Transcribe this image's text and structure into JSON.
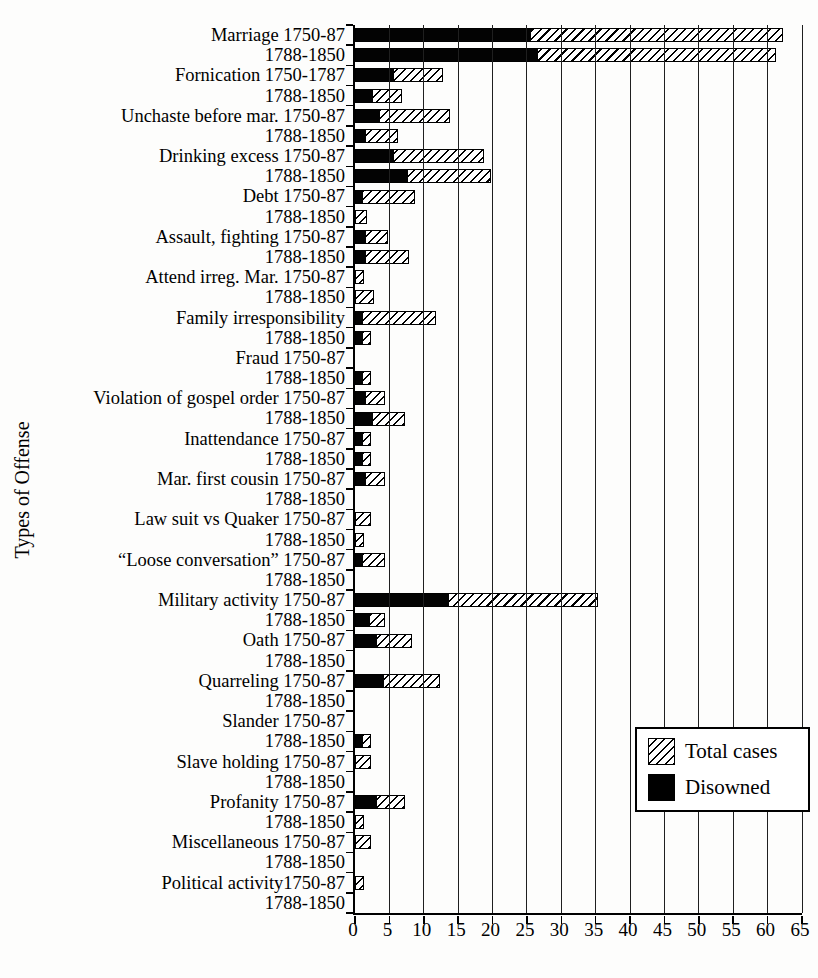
{
  "figure_colors": {
    "background": "#fdfdfc",
    "bar_fill": "#000000",
    "hatch_line": "#000000",
    "grid_line": "#1f1f1f"
  },
  "chart_data": {
    "type": "bar",
    "orientation": "horizontal",
    "title": "",
    "xlabel": "",
    "ylabel": "Types of Offense",
    "xlim": [
      0,
      65
    ],
    "xticks": [
      0,
      5,
      10,
      15,
      20,
      25,
      30,
      35,
      40,
      45,
      50,
      55,
      60,
      65
    ],
    "grid": true,
    "legend_position": "bottom-right",
    "series": [
      {
        "name": "Total cases",
        "style": "hatched"
      },
      {
        "name": "Disowned",
        "style": "solid-black"
      }
    ],
    "rows": [
      {
        "label": "Marriage 1750-87",
        "disowned": 25.5,
        "total": 62
      },
      {
        "label": "1788-1850",
        "disowned": 26.5,
        "total": 61
      },
      {
        "label": "Fornication 1750-1787",
        "disowned": 5.5,
        "total": 12.5
      },
      {
        "label": "1788-1850",
        "disowned": 2.5,
        "total": 6.5
      },
      {
        "label": "Unchaste before mar. 1750-87",
        "disowned": 3.5,
        "total": 13.5
      },
      {
        "label": "1788-1850",
        "disowned": 1.5,
        "total": 6
      },
      {
        "label": "Drinking excess 1750-87",
        "disowned": 5.5,
        "total": 18.5
      },
      {
        "label": "1788-1850",
        "disowned": 7.5,
        "total": 19.5
      },
      {
        "label": "Debt 1750-87",
        "disowned": 1,
        "total": 8.5
      },
      {
        "label": "1788-1850",
        "disowned": 0,
        "total": 1.5
      },
      {
        "label": "Assault, fighting 1750-87",
        "disowned": 1.5,
        "total": 4.5
      },
      {
        "label": "1788-1850",
        "disowned": 1.5,
        "total": 7.5
      },
      {
        "label": "Attend irreg. Mar. 1750-87",
        "disowned": 0,
        "total": 1
      },
      {
        "label": "1788-1850",
        "disowned": 0,
        "total": 2.5
      },
      {
        "label": "Family irresponsibility",
        "disowned": 1,
        "total": 11.5
      },
      {
        "label": "1788-1850",
        "disowned": 1,
        "total": 2
      },
      {
        "label": "Fraud 1750-87",
        "disowned": 0,
        "total": 0
      },
      {
        "label": "1788-1850",
        "disowned": 1,
        "total": 2
      },
      {
        "label": "Violation of gospel order 1750-87",
        "disowned": 1.5,
        "total": 4
      },
      {
        "label": "1788-1850",
        "disowned": 2.5,
        "total": 7
      },
      {
        "label": "Inattendance 1750-87",
        "disowned": 1,
        "total": 2
      },
      {
        "label": "1788-1850",
        "disowned": 1,
        "total": 2
      },
      {
        "label": "Mar. first cousin 1750-87",
        "disowned": 1.5,
        "total": 4
      },
      {
        "label": "1788-1850",
        "disowned": 0,
        "total": 0
      },
      {
        "label": "Law suit vs Quaker 1750-87",
        "disowned": 0,
        "total": 2
      },
      {
        "label": "1788-1850",
        "disowned": 0,
        "total": 1
      },
      {
        "label": "“Loose conversation” 1750-87",
        "disowned": 1,
        "total": 4
      },
      {
        "label": "1788-1850",
        "disowned": 0,
        "total": 0
      },
      {
        "label": "Military activity 1750-87",
        "disowned": 13.5,
        "total": 35
      },
      {
        "label": "1788-1850",
        "disowned": 2,
        "total": 4
      },
      {
        "label": "Oath 1750-87",
        "disowned": 3,
        "total": 8
      },
      {
        "label": "1788-1850",
        "disowned": 0,
        "total": 0
      },
      {
        "label": "Quarreling 1750-87",
        "disowned": 4,
        "total": 12
      },
      {
        "label": "1788-1850",
        "disowned": 0,
        "total": 0
      },
      {
        "label": "Slander 1750-87",
        "disowned": 0,
        "total": 0
      },
      {
        "label": "1788-1850",
        "disowned": 1,
        "total": 2
      },
      {
        "label": "Slave holding 1750-87",
        "disowned": 0,
        "total": 2
      },
      {
        "label": "1788-1850",
        "disowned": 0,
        "total": 0
      },
      {
        "label": "Profanity 1750-87",
        "disowned": 3,
        "total": 7
      },
      {
        "label": "1788-1850",
        "disowned": 0,
        "total": 1
      },
      {
        "label": "Miscellaneous 1750-87",
        "disowned": 0,
        "total": 2
      },
      {
        "label": "1788-1850",
        "disowned": 0,
        "total": 0
      },
      {
        "label": "Political activity1750-87",
        "disowned": 0,
        "total": 1
      },
      {
        "label": "1788-1850",
        "disowned": 0,
        "total": 0
      }
    ]
  }
}
